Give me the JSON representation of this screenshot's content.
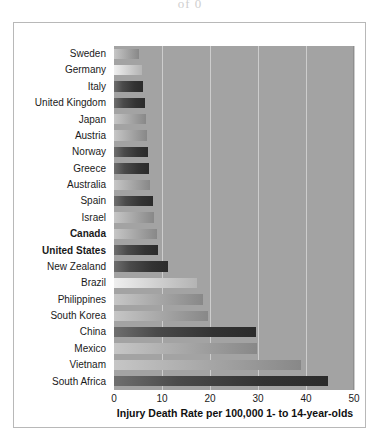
{
  "page": {
    "top_sliver_text": "of 0"
  },
  "chart_data": {
    "type": "bar",
    "orientation": "horizontal",
    "title": "",
    "xlabel": "Injury Death Rate per 100,000 1- to 14-year-olds",
    "ylabel": "",
    "xlim": [
      0,
      50
    ],
    "ylim": null,
    "grid": true,
    "gridlines_at": [
      10,
      20,
      30,
      40,
      50
    ],
    "xticks": [
      "0",
      "10",
      "20",
      "30",
      "40",
      "50"
    ],
    "legend": null,
    "panel_color": "#a3a3a3",
    "categories": [
      "Sweden",
      "Germany",
      "Italy",
      "United Kingdom",
      "Japan",
      "Austria",
      "Norway",
      "Greece",
      "Australia",
      "Spain",
      "Israel",
      "Canada",
      "United States",
      "New Zealand",
      "Brazil",
      "Philippines",
      "South Korea",
      "China",
      "Mexico",
      "Vietnam",
      "South Africa"
    ],
    "values": [
      5.2,
      5.8,
      6.1,
      6.4,
      6.6,
      6.8,
      7.0,
      7.3,
      7.6,
      8.1,
      8.4,
      9.0,
      9.2,
      11.3,
      17.3,
      18.5,
      19.5,
      29.5,
      29.8,
      39.0,
      44.5
    ],
    "highlighted": [
      "Canada",
      "United States"
    ],
    "bar_shades": [
      "mid",
      "light",
      "dark",
      "dark",
      "mid",
      "mid",
      "dark",
      "dark",
      "mid",
      "dark",
      "mid",
      "mid",
      "dark",
      "dark",
      "light",
      "mid",
      "mid",
      "dark",
      "mid",
      "mid",
      "dark"
    ]
  }
}
